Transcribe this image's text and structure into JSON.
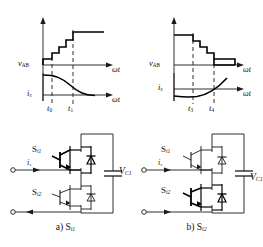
{
  "figure": {
    "domain_type": "circuit-waveform-diagram",
    "panels": [
      {
        "id": "a",
        "caption_prefix": "a)",
        "caption_symbol": "S",
        "caption_sub": "i1",
        "plots": {
          "voltage": {
            "ylabel_main": "v",
            "ylabel_sub": "AB",
            "xlabel": "ωt",
            "waveform": "rising-staircase",
            "steps": 5
          },
          "current": {
            "ylabel_main": "i",
            "ylabel_sub": "s",
            "xlabel": "ωt",
            "waveform": "falling-curve"
          },
          "time_marks": [
            {
              "label_main": "t",
              "label_sub": "0"
            },
            {
              "label_main": "t",
              "label_sub": "1"
            }
          ]
        },
        "circuit": {
          "switch_top": {
            "main": "S",
            "sub": "i1"
          },
          "switch_bottom": {
            "main": "S",
            "sub": "i2"
          },
          "current_label": {
            "main": "i",
            "sub": "s"
          },
          "capacitor_label": {
            "main": "V",
            "sub": "C1"
          },
          "highlighted_switch": "top",
          "current_direction_top": "right",
          "current_direction_bottom": "left"
        }
      },
      {
        "id": "b",
        "caption_prefix": "b)",
        "caption_symbol": "S",
        "caption_sub": "i2",
        "plots": {
          "voltage": {
            "ylabel_main": "v",
            "ylabel_sub": "AB",
            "xlabel": "ωt",
            "waveform": "falling-staircase",
            "steps": 5
          },
          "current": {
            "ylabel_main": "i",
            "ylabel_sub": "s",
            "xlabel": "ωt",
            "waveform": "rising-curve"
          },
          "time_marks": [
            {
              "label_main": "t",
              "label_sub": "3"
            },
            {
              "label_main": "t",
              "label_sub": "4"
            }
          ]
        },
        "circuit": {
          "switch_top": {
            "main": "S",
            "sub": "i1"
          },
          "switch_bottom": {
            "main": "S",
            "sub": "i2"
          },
          "current_label": {
            "main": "i",
            "sub": "s"
          },
          "capacitor_label": {
            "main": "V",
            "sub": "C1"
          },
          "highlighted_switch": "bottom",
          "current_direction_top": "right",
          "current_direction_bottom": "right"
        }
      }
    ],
    "colors": {
      "line": "#1a1a1a",
      "bold_line": "#000000",
      "background": "#ffffff"
    }
  }
}
